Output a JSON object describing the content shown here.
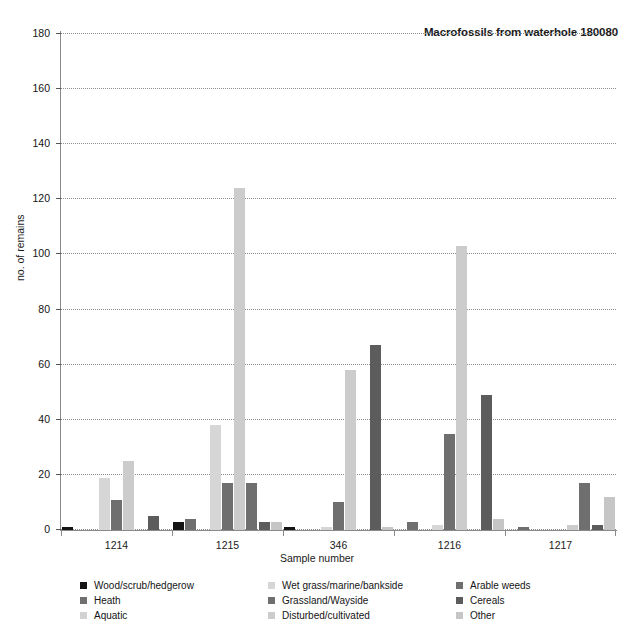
{
  "chart_data": {
    "type": "bar",
    "title": "Macrofossils from waterhole 180080",
    "xlabel": "Sample number",
    "ylabel": "no. of remains",
    "categories": [
      "1214",
      "1215",
      "346",
      "1216",
      "1217"
    ],
    "ylim": [
      0,
      180
    ],
    "yticks": [
      0,
      20,
      40,
      60,
      80,
      100,
      120,
      140,
      160,
      180
    ],
    "grid": true,
    "legend_position": "bottom",
    "series": [
      {
        "name": "Wood/scrub/hedgerow",
        "color": "#141414",
        "values": [
          1,
          3,
          1,
          0,
          0
        ]
      },
      {
        "name": "Heath",
        "color": "#6f6f6f",
        "values": [
          0,
          4,
          0,
          3,
          1
        ]
      },
      {
        "name": "Aquatic",
        "color": "#d2d2d2",
        "values": [
          0,
          0,
          0,
          0,
          0
        ]
      },
      {
        "name": "Wet grass/marine/bankside",
        "color": "#d6d6d6",
        "values": [
          19,
          38,
          1,
          2,
          0
        ]
      },
      {
        "name": "Grassland/Wayside",
        "color": "#6f6f6f",
        "values": [
          11,
          17,
          10,
          35,
          0
        ]
      },
      {
        "name": "Disturbed/cultivated",
        "color": "#cccccc",
        "values": [
          25,
          124,
          58,
          103,
          2
        ]
      },
      {
        "name": "Arable weeds",
        "color": "#6f6f6f",
        "values": [
          0,
          17,
          0,
          0,
          17
        ]
      },
      {
        "name": "Cereals",
        "color": "#5c5c5c",
        "values": [
          5,
          3,
          67,
          49,
          2
        ]
      },
      {
        "name": "Other",
        "color": "#c6c6c6",
        "values": [
          0,
          3,
          1,
          4,
          12
        ]
      }
    ]
  },
  "legend": {
    "columns": [
      {
        "items": [
          {
            "label": "Wood/scrub/hedgerow",
            "color": "#141414"
          },
          {
            "label": "Heath",
            "color": "#6f6f6f"
          },
          {
            "label": "Aquatic",
            "color": "#d2d2d2"
          }
        ]
      },
      {
        "items": [
          {
            "label": "Wet grass/marine/bankside",
            "color": "#d6d6d6"
          },
          {
            "label": "Grassland/Wayside",
            "color": "#6f6f6f"
          },
          {
            "label": "Disturbed/cultivated",
            "color": "#cccccc"
          }
        ]
      },
      {
        "items": [
          {
            "label": "Arable weeds",
            "color": "#6f6f6f"
          },
          {
            "label": "Cereals",
            "color": "#5c5c5c"
          },
          {
            "label": "Other",
            "color": "#c6c6c6"
          }
        ]
      }
    ]
  },
  "caption": ""
}
